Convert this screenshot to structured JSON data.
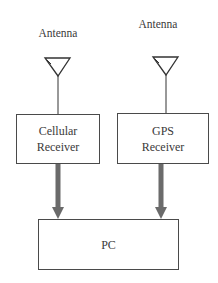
{
  "diagram": {
    "antennas": [
      {
        "label": "Antenna"
      },
      {
        "label": "Antenna"
      }
    ],
    "receivers": [
      {
        "line1": "Cellular",
        "line2": "Receiver"
      },
      {
        "line1": "GPS",
        "line2": "Receiver"
      }
    ],
    "pc": {
      "label": "PC"
    },
    "colors": {
      "line": "#4a4a4a",
      "arrow": "#6b6b6b"
    }
  }
}
